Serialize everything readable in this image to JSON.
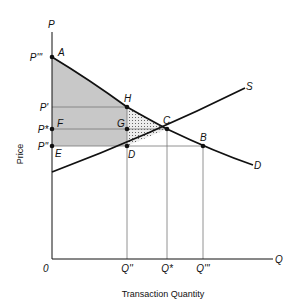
{
  "diagram": {
    "type": "supply-demand consumer/producer surplus",
    "y_axis_label": "Price",
    "x_axis_label": "Transaction Quantity",
    "axis_letters": {
      "y": "P",
      "x": "Q",
      "origin": "0"
    },
    "price_levels": [
      "P'''",
      "P'",
      "P*",
      "P''"
    ],
    "quantity_levels": [
      "Q''",
      "Q*",
      "Q'''"
    ],
    "points": [
      "A",
      "H",
      "F",
      "G",
      "C",
      "E",
      "D",
      "B"
    ],
    "curves": {
      "supply": "S",
      "demand": "D"
    },
    "colors": {
      "shaded": "#c8c8c8",
      "line": "#111111",
      "guide": "#777777"
    }
  }
}
